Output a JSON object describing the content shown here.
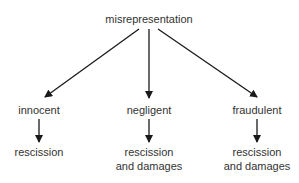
{
  "root": {
    "label": "misrepresentation"
  },
  "branches": [
    {
      "label": "innocent",
      "remedy": [
        "rescission"
      ]
    },
    {
      "label": "negligent",
      "remedy": [
        "rescission",
        "and damages"
      ]
    },
    {
      "label": "fraudulent",
      "remedy": [
        "rescission",
        "and damages"
      ]
    }
  ],
  "colors": {
    "line": "#1a1a1a",
    "text": "#333333"
  }
}
